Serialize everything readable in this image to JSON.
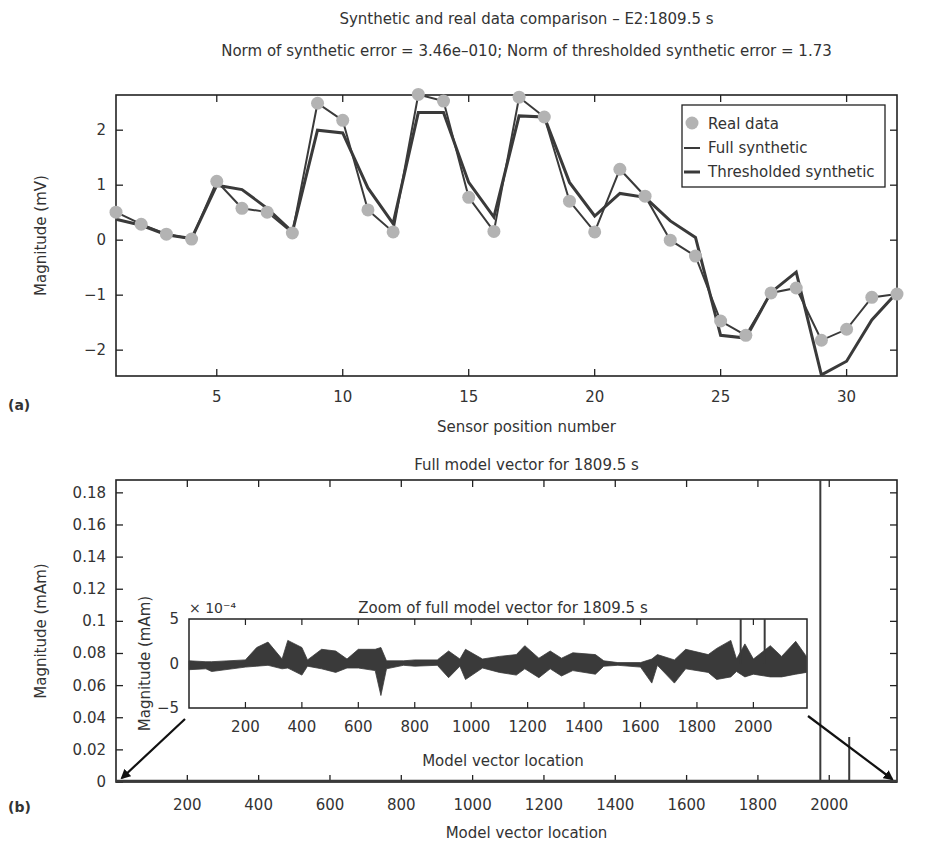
{
  "panel_labels": {
    "a": "(a)",
    "b": "(b)"
  },
  "colors": {
    "axis": "#222222",
    "real": "#b3b3b3",
    "full": "#3a3a3a",
    "thresholded": "#3a3a3a",
    "text": "#333333"
  },
  "chart_data": [
    {
      "id": "a",
      "type": "line",
      "title": "Synthetic and real data comparison – E2:1809.5 s",
      "subtitle": "Norm of synthetic error = 3.46e–010;   Norm of thresholded synthetic error = 1.73",
      "xlabel": "Sensor position number",
      "ylabel": "Magnitude (mV)",
      "xlim": [
        1,
        32
      ],
      "ylim": [
        -2.47,
        2.64
      ],
      "xticks": [
        5,
        10,
        15,
        20,
        25,
        30
      ],
      "yticks": [
        -2,
        -1,
        0,
        1,
        2
      ],
      "legend": {
        "position": "upper right",
        "entries": [
          "Real data",
          "Full synthetic",
          "Thresholded synthetic"
        ]
      },
      "x": [
        1,
        2,
        3,
        4,
        5,
        6,
        7,
        8,
        9,
        10,
        11,
        12,
        13,
        14,
        15,
        16,
        17,
        18,
        19,
        20,
        21,
        22,
        23,
        24,
        25,
        26,
        27,
        28,
        29,
        30,
        31,
        32
      ],
      "series": [
        {
          "name": "Real data",
          "style": "markers",
          "values": [
            0.51,
            0.29,
            0.11,
            0.02,
            1.07,
            0.58,
            0.51,
            0.13,
            2.49,
            2.18,
            0.55,
            0.15,
            2.65,
            2.53,
            0.78,
            0.16,
            2.6,
            2.24,
            0.71,
            0.15,
            1.29,
            0.8,
            0.0,
            -0.29,
            -1.47,
            -1.73,
            -0.96,
            -0.87,
            -1.82,
            -1.62,
            -1.04,
            -0.98
          ]
        },
        {
          "name": "Full synthetic",
          "style": "line",
          "values": [
            0.51,
            0.29,
            0.11,
            0.02,
            1.07,
            0.58,
            0.51,
            0.13,
            2.49,
            2.18,
            0.55,
            0.15,
            2.65,
            2.53,
            0.78,
            0.16,
            2.6,
            2.24,
            0.71,
            0.15,
            1.29,
            0.8,
            0.0,
            -0.29,
            -1.47,
            -1.73,
            -0.96,
            -0.87,
            -1.82,
            -1.62,
            -1.04,
            -0.98
          ]
        },
        {
          "name": "Thresholded synthetic",
          "style": "line",
          "values": [
            0.38,
            0.27,
            0.1,
            0.03,
            1.0,
            0.92,
            0.58,
            0.15,
            2.0,
            1.95,
            0.95,
            0.3,
            2.32,
            2.32,
            1.05,
            0.42,
            2.26,
            2.24,
            1.05,
            0.44,
            0.85,
            0.78,
            0.35,
            0.05,
            -1.73,
            -1.78,
            -0.95,
            -0.58,
            -2.45,
            -2.2,
            -1.45,
            -0.95
          ]
        }
      ]
    },
    {
      "id": "b",
      "type": "line",
      "title": "Full model vector for 1809.5 s",
      "xlabel": "Model vector location",
      "ylabel": "Magnitude (mAm)",
      "xlim": [
        0,
        2190
      ],
      "ylim": [
        0,
        0.188
      ],
      "xticks": [
        200,
        400,
        600,
        800,
        1000,
        1200,
        1400,
        1600,
        1800,
        2000
      ],
      "yticks": [
        0,
        0.02,
        0.04,
        0.06,
        0.08,
        0.1,
        0.12,
        0.14,
        0.16,
        0.18
      ],
      "ytick_labels": [
        "0",
        "0.02",
        "0.04",
        "0.06",
        "0.08",
        "0.1",
        "0.12",
        "0.14",
        "0.16",
        "0.18"
      ],
      "spikes": [
        {
          "x": 1975,
          "y": 0.19
        },
        {
          "x": 2056,
          "y": 0.028
        }
      ],
      "baseline": 0
    },
    {
      "id": "b-inset",
      "type": "line",
      "title": "Zoom of full model vector for 1809.5 s",
      "xlabel": "Model vector location",
      "ylabel": "Magnitude (mAm)",
      "y_multiplier": "× 10⁻⁴",
      "xlim": [
        0,
        2190
      ],
      "ylim": [
        -5,
        5
      ],
      "xticks": [
        200,
        400,
        600,
        800,
        1000,
        1200,
        1400,
        1600,
        1800,
        2000
      ],
      "yticks": [
        -5,
        0,
        5
      ],
      "ytick_labels": [
        "−5",
        "0",
        "5"
      ],
      "envelope": {
        "x": [
          0,
          60,
          80,
          200,
          240,
          280,
          330,
          350,
          400,
          420,
          470,
          520,
          560,
          600,
          660,
          680,
          700,
          760,
          800,
          880,
          920,
          960,
          980,
          1040,
          1100,
          1160,
          1190,
          1240,
          1280,
          1320,
          1360,
          1440,
          1470,
          1520,
          1600,
          1640,
          1660,
          1720,
          1760,
          1840,
          1870,
          1920,
          1940,
          1970,
          2000,
          2060,
          2100,
          2150,
          2188
        ],
        "upper": [
          0.3,
          0.2,
          0.2,
          0.4,
          1.8,
          2.4,
          0.5,
          2.6,
          1.8,
          0.4,
          1.6,
          1.4,
          0.5,
          1.6,
          1.6,
          1.8,
          0.3,
          0.3,
          0.4,
          0.4,
          1.4,
          0.5,
          1.6,
          0.5,
          0.8,
          1.0,
          2.0,
          0.6,
          1.4,
          0.6,
          1.2,
          1.0,
          0.3,
          0.1,
          0.1,
          0.5,
          1.0,
          0.4,
          1.6,
          1.0,
          1.7,
          2.6,
          0.5,
          2.2,
          0.5,
          2.0,
          0.8,
          2.5,
          0.8
        ],
        "lower": [
          -0.7,
          -0.6,
          -0.9,
          -0.4,
          -0.3,
          -0.2,
          -0.6,
          -0.5,
          -1.3,
          -0.3,
          -0.6,
          -1.0,
          -0.5,
          -0.5,
          -0.8,
          -3.6,
          -0.6,
          -0.2,
          -0.3,
          -0.2,
          -1.6,
          -0.3,
          -1.8,
          -0.5,
          -1.0,
          -1.3,
          -0.6,
          -1.6,
          -0.6,
          -1.4,
          -0.8,
          -1.2,
          -0.3,
          -0.2,
          -0.4,
          -2.2,
          -0.2,
          -2.2,
          -0.6,
          -1.0,
          -1.8,
          -1.5,
          -0.9,
          -1.5,
          -1.2,
          -1.5,
          -1.5,
          -1.2,
          -1.0
        ]
      },
      "spikes": [
        {
          "x": 1955,
          "y": 5
        },
        {
          "x": 2040,
          "y": 5
        }
      ]
    }
  ]
}
